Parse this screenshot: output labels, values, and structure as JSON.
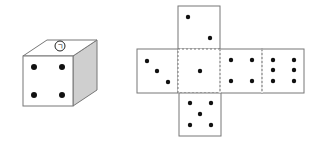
{
  "diagram": {
    "cube": {
      "front_face_pips": 4,
      "top_face_label": "ㄱ",
      "top_face_label_style": "circled"
    },
    "net": {
      "layout": "cross",
      "faces": [
        {
          "position": "top",
          "pips": 2
        },
        {
          "position": "left",
          "pips": 3
        },
        {
          "position": "center",
          "pips": 1
        },
        {
          "position": "right-1",
          "pips": 4
        },
        {
          "position": "right-2",
          "pips": 6
        },
        {
          "position": "bottom",
          "pips": 5
        }
      ],
      "fold_lines": "dashed"
    },
    "colors": {
      "outline": "#666666",
      "pip": "#111111",
      "side_shade": "#cfcfcf",
      "background": "#ffffff"
    }
  }
}
